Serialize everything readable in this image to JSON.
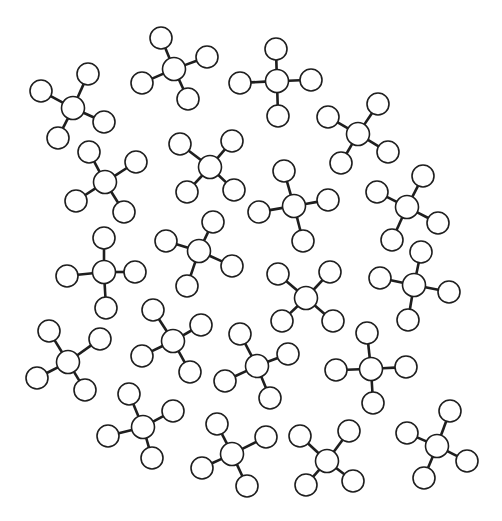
{
  "diagram": {
    "background": "#ffffff",
    "stroke_color": "#1e1e1e",
    "atom_radius": 11,
    "central_atom_radius": 11.5,
    "molecule_count": 20,
    "molecules": [
      {
        "id": "m1",
        "center": [
          73,
          108
        ],
        "outer": [
          [
            41,
            91
          ],
          [
            88,
            74
          ],
          [
            104,
            122
          ],
          [
            58,
            138
          ]
        ]
      },
      {
        "id": "m2",
        "center": [
          174,
          69
        ],
        "outer": [
          [
            161,
            38
          ],
          [
            207,
            57
          ],
          [
            142,
            83
          ],
          [
            188,
            99
          ]
        ]
      },
      {
        "id": "m3",
        "center": [
          277,
          81
        ],
        "outer": [
          [
            276,
            49
          ],
          [
            311,
            80
          ],
          [
            240,
            83
          ],
          [
            278,
            116
          ]
        ]
      },
      {
        "id": "m4",
        "center": [
          358,
          134
        ],
        "outer": [
          [
            378,
            104
          ],
          [
            328,
            117
          ],
          [
            388,
            152
          ],
          [
            341,
            163
          ]
        ]
      },
      {
        "id": "m5",
        "center": [
          105,
          182
        ],
        "outer": [
          [
            89,
            152
          ],
          [
            136,
            162
          ],
          [
            76,
            201
          ],
          [
            124,
            212
          ]
        ]
      },
      {
        "id": "m6",
        "center": [
          210,
          167
        ],
        "outer": [
          [
            180,
            144
          ],
          [
            232,
            141
          ],
          [
            187,
            192
          ],
          [
            234,
            190
          ]
        ]
      },
      {
        "id": "m7",
        "center": [
          294,
          206
        ],
        "outer": [
          [
            284,
            171
          ],
          [
            328,
            200
          ],
          [
            259,
            212
          ],
          [
            303,
            241
          ]
        ]
      },
      {
        "id": "m8",
        "center": [
          407,
          207
        ],
        "outer": [
          [
            423,
            176
          ],
          [
            377,
            192
          ],
          [
            438,
            223
          ],
          [
            392,
            240
          ]
        ]
      },
      {
        "id": "m9",
        "center": [
          104,
          272
        ],
        "outer": [
          [
            104,
            238
          ],
          [
            135,
            272
          ],
          [
            67,
            276
          ],
          [
            106,
            308
          ]
        ]
      },
      {
        "id": "m10",
        "center": [
          199,
          251
        ],
        "outer": [
          [
            213,
            222
          ],
          [
            166,
            241
          ],
          [
            232,
            266
          ],
          [
            187,
            286
          ]
        ]
      },
      {
        "id": "m11",
        "center": [
          306,
          298
        ],
        "outer": [
          [
            278,
            274
          ],
          [
            330,
            272
          ],
          [
            282,
            321
          ],
          [
            333,
            321
          ]
        ]
      },
      {
        "id": "m12",
        "center": [
          414,
          285
        ],
        "outer": [
          [
            421,
            252
          ],
          [
            380,
            278
          ],
          [
            449,
            292
          ],
          [
            408,
            320
          ]
        ]
      },
      {
        "id": "m13",
        "center": [
          68,
          362
        ],
        "outer": [
          [
            49,
            331
          ],
          [
            100,
            339
          ],
          [
            37,
            378
          ],
          [
            85,
            390
          ]
        ]
      },
      {
        "id": "m14",
        "center": [
          173,
          341
        ],
        "outer": [
          [
            153,
            310
          ],
          [
            201,
            325
          ],
          [
            142,
            356
          ],
          [
            190,
            372
          ]
        ]
      },
      {
        "id": "m15",
        "center": [
          257,
          366
        ],
        "outer": [
          [
            240,
            334
          ],
          [
            288,
            354
          ],
          [
            225,
            381
          ],
          [
            270,
            398
          ]
        ]
      },
      {
        "id": "m16",
        "center": [
          371,
          369
        ],
        "outer": [
          [
            367,
            333
          ],
          [
            406,
            367
          ],
          [
            336,
            370
          ],
          [
            373,
            403
          ]
        ]
      },
      {
        "id": "m17",
        "center": [
          143,
          427
        ],
        "outer": [
          [
            129,
            394
          ],
          [
            173,
            411
          ],
          [
            108,
            436
          ],
          [
            152,
            458
          ]
        ]
      },
      {
        "id": "m18",
        "center": [
          232,
          454
        ],
        "outer": [
          [
            217,
            424
          ],
          [
            266,
            437
          ],
          [
            202,
            468
          ],
          [
            247,
            486
          ]
        ]
      },
      {
        "id": "m19",
        "center": [
          327,
          461
        ],
        "outer": [
          [
            300,
            436
          ],
          [
            349,
            431
          ],
          [
            306,
            485
          ],
          [
            353,
            481
          ]
        ]
      },
      {
        "id": "m20",
        "center": [
          437,
          446
        ],
        "outer": [
          [
            450,
            411
          ],
          [
            407,
            433
          ],
          [
            467,
            461
          ],
          [
            424,
            478
          ]
        ]
      }
    ]
  }
}
